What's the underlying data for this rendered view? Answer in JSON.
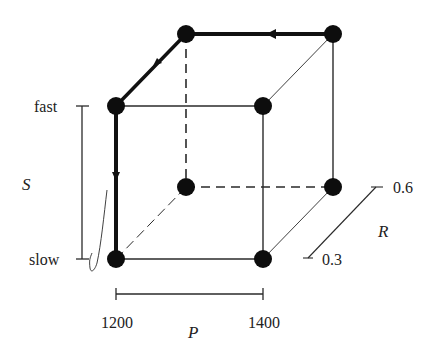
{
  "diagram": {
    "type": "cube-design-space",
    "colors": {
      "line": "#2a2a2a",
      "path": "#111111",
      "node": "#0d0d0d",
      "text": "#222222"
    },
    "axes": {
      "S": {
        "label": "S",
        "low": "slow",
        "high": "fast"
      },
      "P": {
        "label": "P",
        "low": "1200",
        "high": "1400"
      },
      "R": {
        "label": "R",
        "low": "0.3",
        "high": "0.6"
      }
    },
    "nodes": [
      {
        "id": "front-bottom-left",
        "S": "slow",
        "P": "1200",
        "R": "0.3"
      },
      {
        "id": "front-bottom-right",
        "S": "slow",
        "P": "1400",
        "R": "0.3"
      },
      {
        "id": "front-top-left",
        "S": "fast",
        "P": "1200",
        "R": "0.3"
      },
      {
        "id": "front-top-right",
        "S": "fast",
        "P": "1400",
        "R": "0.3"
      },
      {
        "id": "back-bottom-left",
        "S": "slow",
        "P": "1200",
        "R": "0.6"
      },
      {
        "id": "back-bottom-right",
        "S": "slow",
        "P": "1400",
        "R": "0.6"
      },
      {
        "id": "back-top-left",
        "S": "fast",
        "P": "1200",
        "R": "0.6"
      },
      {
        "id": "back-top-right",
        "S": "fast",
        "P": "1400",
        "R": "0.6"
      }
    ],
    "path": [
      "back-top-right",
      "back-top-left",
      "front-top-left",
      "front-bottom-left"
    ],
    "hidden_edges": [
      "back-bottom-left to back-top-left",
      "back-bottom-left to back-bottom-right",
      "back-bottom-left to front-bottom-left"
    ]
  }
}
